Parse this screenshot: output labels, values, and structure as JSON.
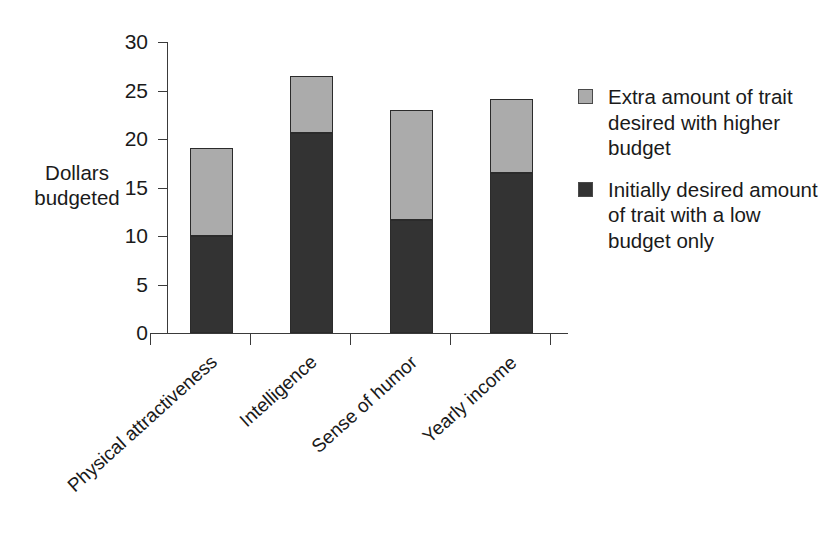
{
  "chart_data": {
    "type": "bar",
    "subtype": "stacked-column",
    "title": "",
    "xlabel": "",
    "ylabel": "Dollars budgeted",
    "ylabel_lines": [
      "Dollars",
      "budgeted"
    ],
    "ylim": [
      0,
      30
    ],
    "yticks": [
      0,
      5,
      10,
      15,
      20,
      25,
      30
    ],
    "ytick_labels": [
      "0",
      "5",
      "10",
      "15",
      "20",
      "25",
      "30"
    ],
    "grid": false,
    "legend_position": "right",
    "categories": [
      "Physical attractiveness",
      "Intelligence",
      "Sense of humor",
      "Yearly income"
    ],
    "series": [
      {
        "name": "Initially desired amount of trait with a low budget only",
        "name_lines": [
          "Initially desired amount",
          "of trait with a low",
          "budget only"
        ],
        "color": "#333333",
        "values": [
          10.0,
          20.6,
          11.6,
          16.5
        ]
      },
      {
        "name": "Extra amount of trait desired with higher budget",
        "name_lines": [
          "Extra amount of trait",
          "desired with higher",
          "budget"
        ],
        "color": "#ababab",
        "values": [
          9.1,
          5.9,
          11.4,
          7.6
        ]
      }
    ],
    "totals": [
      19.1,
      26.5,
      23.0,
      24.1
    ]
  },
  "colors": {
    "light_gray": "#ababab",
    "dark_gray": "#333333",
    "outline": "#2b2b2b",
    "axis": "#3a3a3a",
    "text": "#1a1a1a",
    "background": "#ffffff"
  }
}
